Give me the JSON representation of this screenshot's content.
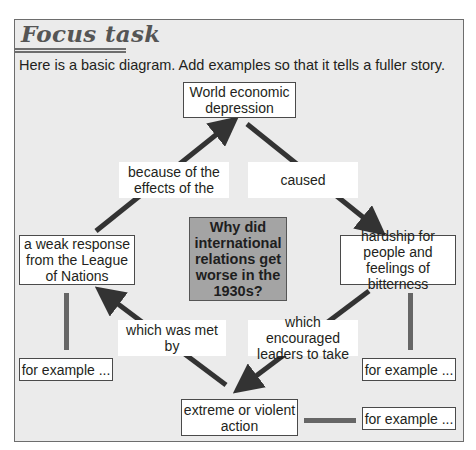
{
  "header": {
    "title": "Focus task",
    "instruction": "Here is a basic diagram. Add examples so that it tells a fuller story."
  },
  "diagram": {
    "central_question": "Why did international relations get worse in the 1930s?",
    "nodes": {
      "top": "World economic depression",
      "right": "hardship for people and feelings of bitterness",
      "bottom": "extreme or violent action",
      "left": "a weak response from the League of Nations"
    },
    "connectors": {
      "top_to_right": "caused",
      "right_to_bottom": "which encouraged leaders to take",
      "bottom_to_left": "which was met by",
      "left_to_top": "because of the effects of the"
    },
    "example_boxes": {
      "left": "for example ...",
      "right": "for example ...",
      "bottom": "for example ..."
    },
    "colors": {
      "panel_bg": "#ebebeb",
      "arrow": "#333333",
      "link_bar": "#666666",
      "center_box": "#a4a4a4"
    }
  }
}
